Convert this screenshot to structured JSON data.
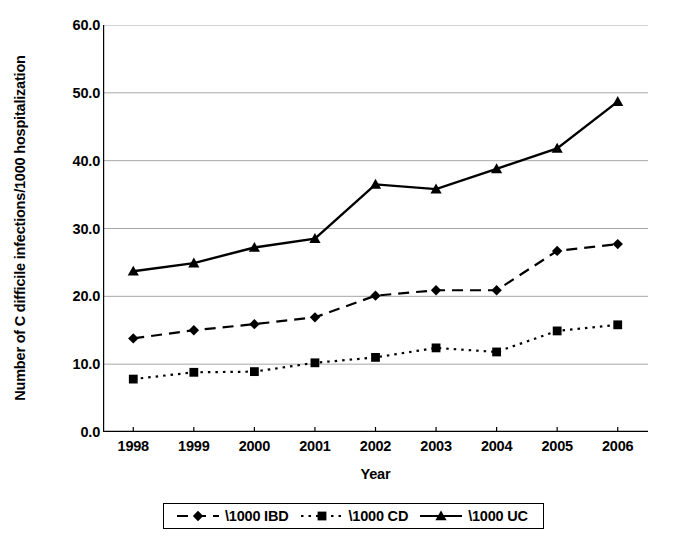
{
  "chart_data": {
    "type": "line",
    "title": "",
    "xlabel": "Year",
    "ylabel": "Number of C difficile infections/1000 hospitalization",
    "categories": [
      "1998",
      "1999",
      "2000",
      "2001",
      "2002",
      "2003",
      "2004",
      "2005",
      "2006"
    ],
    "x": [
      1998,
      1999,
      2000,
      2001,
      2002,
      2003,
      2004,
      2005,
      2006
    ],
    "ylim": [
      0.0,
      60.0
    ],
    "yticks": [
      "0.0",
      "10.0",
      "20.0",
      "30.0",
      "40.0",
      "50.0",
      "60.0"
    ],
    "ytick_values": [
      0.0,
      10.0,
      20.0,
      30.0,
      40.0,
      50.0,
      60.0
    ],
    "grid": true,
    "legend_position": "bottom",
    "series": [
      {
        "name": "\\1000 IBD",
        "marker": "diamond",
        "linestyle": "dashed",
        "color": "#000000",
        "values": [
          13.8,
          15.0,
          15.9,
          16.9,
          20.1,
          20.9,
          20.9,
          26.7,
          27.7
        ]
      },
      {
        "name": "\\1000 CD",
        "marker": "square",
        "linestyle": "dotted",
        "color": "#000000",
        "values": [
          7.8,
          8.8,
          8.9,
          10.2,
          11.0,
          12.4,
          11.8,
          14.9,
          15.8
        ]
      },
      {
        "name": "\\1000 UC",
        "marker": "triangle",
        "linestyle": "solid",
        "color": "#000000",
        "values": [
          23.7,
          24.9,
          27.2,
          28.5,
          36.5,
          35.8,
          38.8,
          41.8,
          48.7
        ]
      }
    ]
  },
  "axis": {
    "y_title": "Number of C difficile infections/1000 hospitalization",
    "x_title": "Year"
  },
  "legend": {
    "items": [
      {
        "label": "\\1000 IBD"
      },
      {
        "label": "\\1000 CD"
      },
      {
        "label": "\\1000 UC"
      }
    ]
  },
  "colors": {
    "ink": "#000000",
    "grid": "#a8a8a8",
    "background": "#ffffff"
  }
}
